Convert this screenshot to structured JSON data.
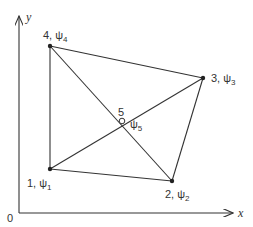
{
  "axes": {
    "origin_label": "0",
    "x_label": "x",
    "y_label": "y"
  },
  "nodes": [
    {
      "id": "1",
      "label": "1, ψ",
      "sub": "1",
      "x": 50,
      "y": 169,
      "marker": "filled"
    },
    {
      "id": "2",
      "label": "2, ψ",
      "sub": "2",
      "x": 172,
      "y": 181,
      "marker": "filled"
    },
    {
      "id": "3",
      "label": "3, ψ",
      "sub": "3",
      "x": 203,
      "y": 78,
      "marker": "filled"
    },
    {
      "id": "4",
      "label": "4, ψ",
      "sub": "4",
      "x": 50,
      "y": 46,
      "marker": "filled"
    },
    {
      "id": "5",
      "label": "5",
      "psi_label": "ψ",
      "sub": "5",
      "x": 122,
      "y": 121,
      "marker": "open"
    }
  ],
  "edges": [
    [
      "1",
      "2"
    ],
    [
      "2",
      "3"
    ],
    [
      "3",
      "4"
    ],
    [
      "4",
      "1"
    ],
    [
      "4",
      "2"
    ],
    [
      "1",
      "3"
    ]
  ]
}
